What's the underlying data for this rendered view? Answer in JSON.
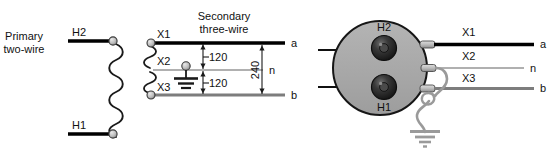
{
  "figure": {
    "colors": {
      "wire_black": "#000000",
      "wire_gray_mid": "#808080",
      "wire_gray_light": "#b5b5b5",
      "tank_fill": "#a8a8a8",
      "tank_stroke": "#1a1a1a",
      "bushing_dark": "#2b2b2b",
      "ground_wire": "#9a9a9a",
      "terminal_fill": "#c9c9c9",
      "text": "#111111"
    }
  },
  "schematic": {
    "primary": {
      "caption_line1": "Primary",
      "caption_line2": "two-wire",
      "terminal_top_label": "H2",
      "terminal_bottom_label": "H1",
      "coil_turns": 11
    },
    "secondary": {
      "caption_line1": "Secondary",
      "caption_line2": "three-wire",
      "terminal_labels": {
        "x1": "X1",
        "x2": "X2",
        "x3": "X3"
      },
      "line_labels": {
        "a": "a",
        "n": "n",
        "b": "b"
      },
      "voltages": {
        "upper_half": "120",
        "lower_half": "120",
        "full": "240"
      },
      "ground_at": "X2",
      "coil_turns_per_half": 4
    }
  },
  "pictorial": {
    "tank_shape": "circle",
    "primary_bushings": [
      {
        "label": "H2"
      },
      {
        "label": "H1"
      }
    ],
    "secondary_terminals": [
      {
        "label": "X1",
        "line": "a"
      },
      {
        "label": "X2",
        "line": "n"
      },
      {
        "label": "X3",
        "line": "b"
      }
    ],
    "line_labels": {
      "a": "a",
      "n": "n",
      "b": "b"
    },
    "grounded_terminal": "X2"
  }
}
